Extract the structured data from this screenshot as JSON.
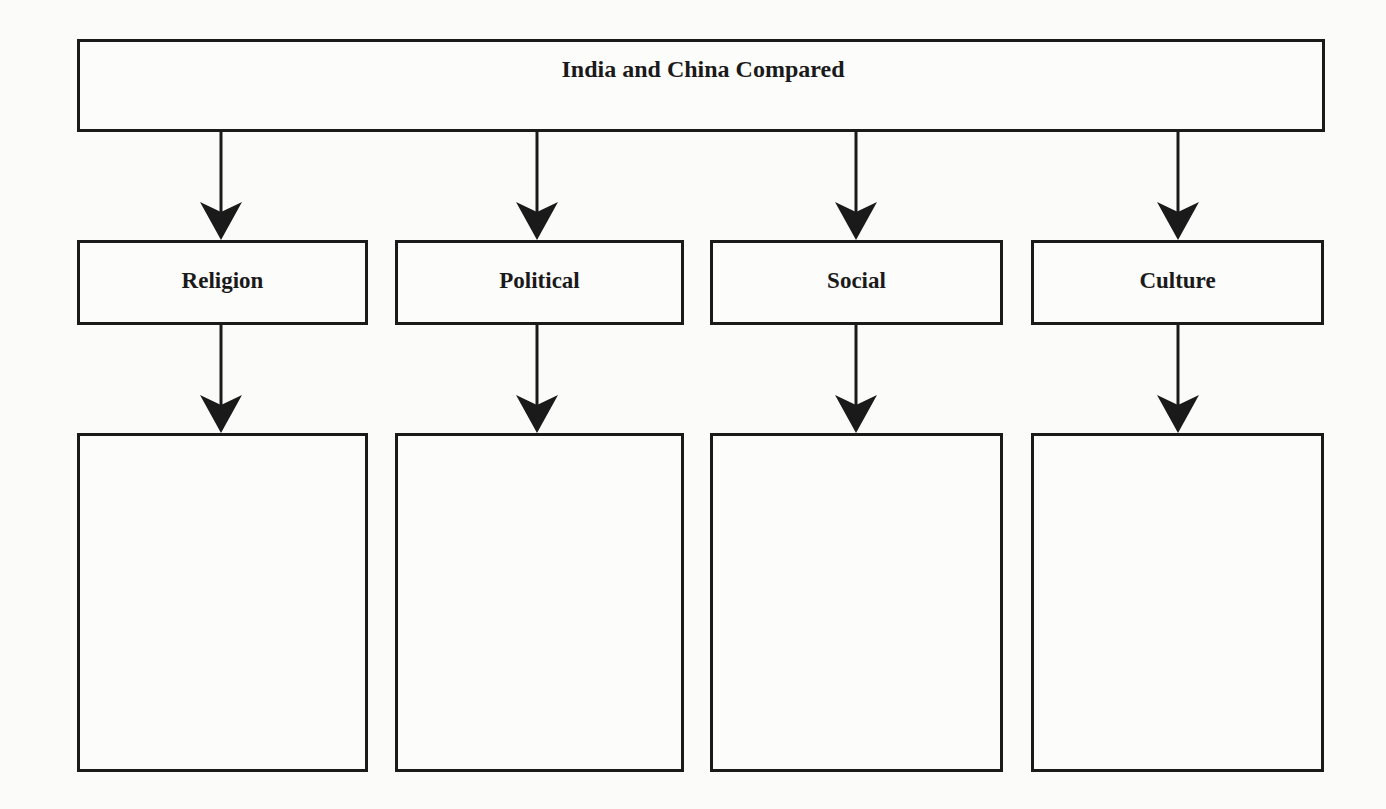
{
  "diagram": {
    "title": "India and China Compared",
    "categories": [
      {
        "label": "Religion",
        "content": ""
      },
      {
        "label": "Political",
        "content": ""
      },
      {
        "label": "Social",
        "content": ""
      },
      {
        "label": "Culture",
        "content": ""
      }
    ],
    "colors": {
      "stroke": "#1a1a1a",
      "background": "#fbfbf9"
    }
  }
}
